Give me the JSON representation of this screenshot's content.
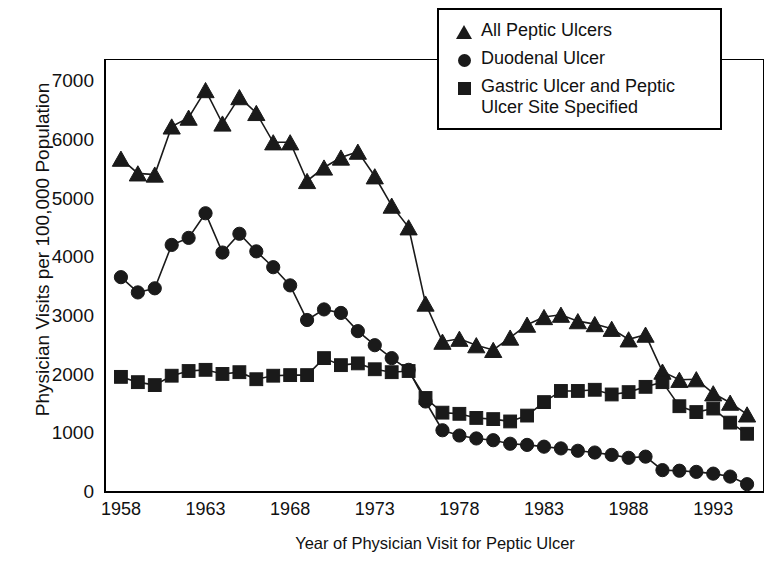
{
  "chart_data": {
    "type": "line",
    "title": "",
    "xlabel": "Year of Physician Visit for Peptic Ulcer",
    "ylabel": "Physician Visits per 100,000 Population",
    "xlim": [
      1957,
      1996
    ],
    "ylim": [
      0,
      7400
    ],
    "xticks": [
      1958,
      1963,
      1968,
      1973,
      1978,
      1983,
      1988,
      1993
    ],
    "yticks": [
      0,
      1000,
      2000,
      3000,
      4000,
      5000,
      6000,
      7000
    ],
    "grid": false,
    "legend_position": "top-right",
    "x": [
      1958,
      1959,
      1960,
      1961,
      1962,
      1963,
      1964,
      1965,
      1966,
      1967,
      1968,
      1969,
      1970,
      1971,
      1972,
      1973,
      1974,
      1975,
      1976,
      1977,
      1978,
      1979,
      1980,
      1981,
      1982,
      1983,
      1984,
      1985,
      1986,
      1987,
      1988,
      1989,
      1990,
      1991,
      1992,
      1993,
      1994,
      1995
    ],
    "series": [
      {
        "name": "All Peptic Ulcers",
        "marker": "triangle",
        "values": [
          5700,
          5450,
          5430,
          6250,
          6400,
          6870,
          6300,
          6750,
          6480,
          5980,
          5980,
          5320,
          5550,
          5720,
          5820,
          5400,
          4900,
          4530,
          3230,
          2580,
          2630,
          2520,
          2440,
          2650,
          2870,
          3000,
          3040,
          2930,
          2880,
          2800,
          2620,
          2700,
          2070,
          1930,
          1940,
          1700,
          1540,
          1340
        ]
      },
      {
        "name": "Duodenal Ulcer",
        "marker": "circle",
        "values": [
          3680,
          3420,
          3490,
          4230,
          4350,
          4770,
          4100,
          4420,
          4120,
          3850,
          3540,
          2950,
          3130,
          3070,
          2760,
          2520,
          2300,
          2100,
          1560,
          1070,
          980,
          930,
          900,
          840,
          820,
          790,
          760,
          720,
          690,
          650,
          600,
          620,
          390,
          380,
          360,
          330,
          280,
          150
        ]
      },
      {
        "name": "Gastric Ulcer and Peptic Ulcer Site Specified",
        "marker": "square",
        "values": [
          1980,
          1890,
          1840,
          2000,
          2080,
          2100,
          2030,
          2060,
          1940,
          2000,
          2010,
          2010,
          2300,
          2180,
          2210,
          2110,
          2060,
          2080,
          1620,
          1370,
          1350,
          1280,
          1260,
          1220,
          1320,
          1550,
          1740,
          1740,
          1760,
          1680,
          1720,
          1810,
          1890,
          1480,
          1380,
          1440,
          1200,
          1010
        ]
      }
    ]
  },
  "legend": {
    "entries": [
      {
        "label": "All Peptic Ulcers",
        "marker": "triangle"
      },
      {
        "label": "Duodenal Ulcer",
        "marker": "circle"
      },
      {
        "label": "Gastric Ulcer and Peptic Ulcer Site Specified",
        "marker": "square"
      }
    ],
    "entry_lines": [
      [
        "All Peptic Ulcers"
      ],
      [
        "Duodenal Ulcer"
      ],
      [
        "Gastric Ulcer and Peptic",
        "Ulcer Site Specified"
      ]
    ]
  },
  "axes": {
    "y_title": "Physician Visits per 100,000 Population",
    "x_title": "Year of Physician Visit for Peptic Ulcer",
    "y_tick_labels": [
      "7000",
      "6000",
      "5000",
      "4000",
      "3000",
      "2000",
      "1000",
      "0"
    ],
    "x_tick_labels": [
      "1958",
      "1963",
      "1968",
      "1973",
      "1978",
      "1983",
      "1988",
      "1993"
    ]
  },
  "colors": {
    "ink": "#1a1a1a",
    "frame": "#000000",
    "background": "#ffffff"
  }
}
